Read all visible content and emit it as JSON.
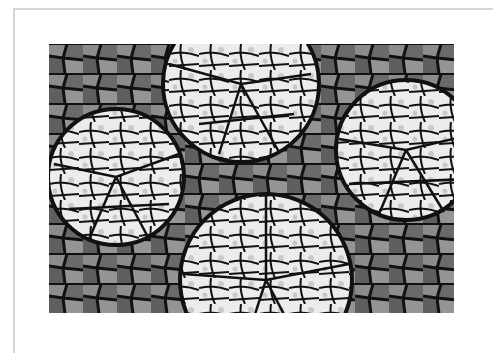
{
  "image": {
    "description": "Black-and-white photograph of a stained-glass style mosaic with four white circular plate-shard medallions set among grey tiles, mounted on a white mat",
    "subject": "mosaic",
    "colors": {
      "mat": "#ffffff",
      "frame_line": "#d4d4d4",
      "grout": "#111111",
      "light_tile": "#ececec",
      "mid_tile": "#8a8a8a",
      "dark_tile": "#5e5e5e"
    },
    "medallions": [
      {
        "name": "top-center",
        "cx": 192,
        "cy": 40,
        "r": 78
      },
      {
        "name": "left",
        "cx": 67,
        "cy": 133,
        "r": 68
      },
      {
        "name": "right",
        "cx": 357,
        "cy": 106,
        "r": 70
      },
      {
        "name": "bottom-center",
        "cx": 217,
        "cy": 236,
        "r": 86
      }
    ]
  }
}
